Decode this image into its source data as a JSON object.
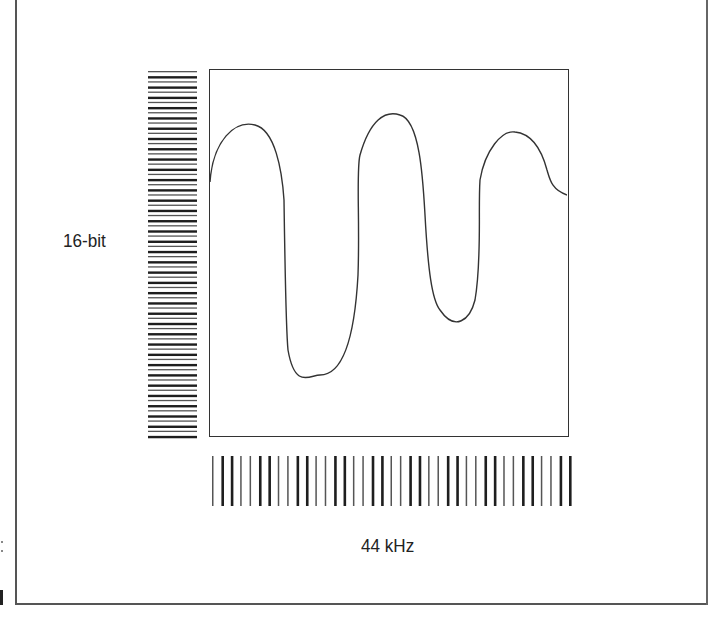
{
  "labels": {
    "bit_depth": "16-bit",
    "sample_rate": "44 kHz"
  },
  "colors": {
    "line": "#333333",
    "bars": "#222222",
    "background": "#ffffff"
  },
  "diagram": {
    "amplitude_levels_bar_count": 72,
    "sample_bar_count": 39,
    "waveform_peaks": 3,
    "waveform_troughs": 2
  }
}
